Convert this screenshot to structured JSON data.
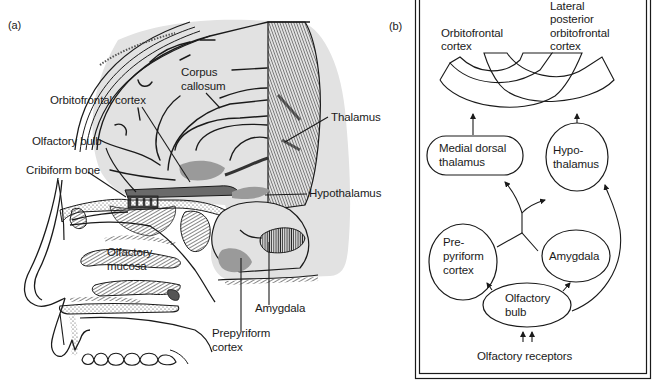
{
  "figure": {
    "panel_a": {
      "letter": "(a)",
      "labels": {
        "corpus_callosum_1": "Corpus",
        "corpus_callosum_2": "callosum",
        "orbitofrontal_cortex": "Orbitofrontal cortex",
        "olfactory_bulb": "Olfactory bulb",
        "cribiform_bone": "Cribiform bone",
        "thalamus": "Thalamus",
        "hypothalamus": "Hypothalamus",
        "olfactory_mucosa_1": "Olfactory",
        "olfactory_mucosa_2": "mucosa",
        "amygdala": "Amygdala",
        "prepyriform_cortex_1": "Prepyriform",
        "prepyriform_cortex_2": "cortex"
      }
    },
    "panel_b": {
      "letter": "(b)",
      "nodes": {
        "orbitofrontal_1": "Orbitofrontal",
        "orbitofrontal_2": "cortex",
        "lateral_posterior_1": "Lateral",
        "lateral_posterior_2": "posterior",
        "lateral_posterior_3": "orbitofrontal",
        "lateral_posterior_4": "cortex",
        "medial_dorsal_1": "Medial dorsal",
        "medial_dorsal_2": "thalamus",
        "hypothalamus_1": "Hypo-",
        "hypothalamus_2": "thalamus",
        "prepyriform_1": "Pre-",
        "prepyriform_2": "pyriform",
        "prepyriform_3": "cortex",
        "amygdala": "Amygdala",
        "olfactory_bulb_1": "Olfactory",
        "olfactory_bulb_2": "bulb",
        "olfactory_receptors": "Olfactory receptors"
      },
      "edges": [
        {
          "from": "Olfactory receptors",
          "to": "Olfactory bulb"
        },
        {
          "from": "Olfactory bulb",
          "to": "Prepyriform cortex"
        },
        {
          "from": "Olfactory bulb",
          "to": "Amygdala"
        },
        {
          "from": "Olfactory bulb",
          "to": "Hypothalamus"
        },
        {
          "from": "Prepyriform cortex",
          "to": "Medial dorsal thalamus"
        },
        {
          "from": "Prepyriform cortex",
          "to": "Hypothalamus"
        },
        {
          "from": "Amygdala",
          "to": "Medial dorsal thalamus"
        },
        {
          "from": "Amygdala",
          "to": "Hypothalamus"
        },
        {
          "from": "Medial dorsal thalamus",
          "to": "Orbitofrontal cortex"
        },
        {
          "from": "Hypothalamus",
          "to": "Lateral posterior orbitofrontal cortex"
        }
      ]
    },
    "colors": {
      "ink": "#1a1a1a",
      "brain_gray": "#e2e2e2",
      "highlight_gray": "#9a9a9a",
      "paper": "#ffffff"
    }
  }
}
